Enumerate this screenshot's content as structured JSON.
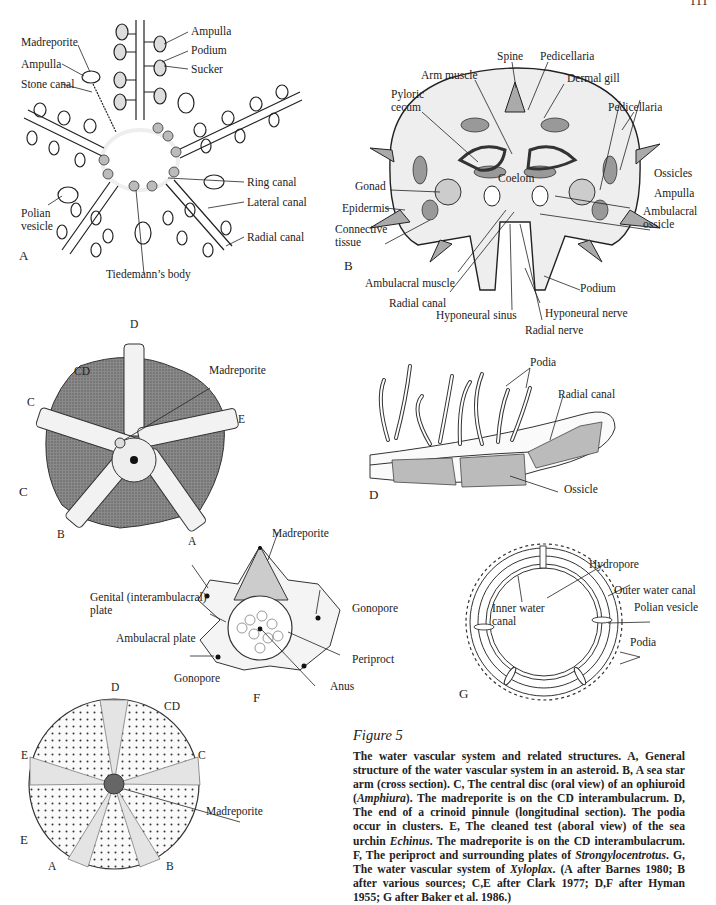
{
  "page": {
    "page_number": "111"
  },
  "figure": {
    "title": "Figure 5",
    "caption_parts": [
      {
        "t": "The water vascular system and related structures. A, General structure of the water vascular system in an asteroid. B, A sea star arm (cross section). C, The central disc (oral view) of an ophiuroid ("
      },
      {
        "t": "Amphiura",
        "i": true
      },
      {
        "t": "). The madreporite is on the CD interambulacrum. D, The end of a crinoid pinnule (longitudinal section). The podia occur in clusters. E, The cleaned test (aboral view) of the sea urchin "
      },
      {
        "t": "Echinus",
        "i": true
      },
      {
        "t": ". The madreporite is on the CD interambulacrum. F, The periproct and surrounding plates of "
      },
      {
        "t": "Strongylocentrotus",
        "i": true
      },
      {
        "t": ". G, The water vascular system of "
      },
      {
        "t": "Xyloplax",
        "i": true
      },
      {
        "t": ". (A after Barnes 1980; B after various sources; C,E after Clark 1977; D,F after Hyman 1955; G after Baker et al. 1986.)"
      }
    ]
  },
  "panels": {
    "A": {
      "letter": "A",
      "subject": "asteroid water vascular system",
      "labels": {
        "madreporite": "Madreporite",
        "ampulla_left": "Ampulla",
        "stone_canal": "Stone canal",
        "ampulla_right": "Ampulla",
        "podium": "Podium",
        "sucker": "Sucker",
        "ring_canal": "Ring canal",
        "lateral_canal": "Lateral canal",
        "radial_canal": "Radial canal",
        "polian_vesicle": "Polian vesicle",
        "tiedemanns_body": "Tiedemann’s body"
      }
    },
    "B": {
      "letter": "B",
      "subject": "sea star arm cross section",
      "labels": {
        "spine": "Spine",
        "pedicellaria_top": "Pedicellaria",
        "arm_muscle": "Arm muscle",
        "dermal_gill": "Dermal gill",
        "pyloric_cecum": "Pyloric cecum",
        "pedicellaria_right": "Pedicellaria",
        "ossicles": "Ossicles",
        "coelom": "Coelom",
        "gonad": "Gonad",
        "ampulla": "Ampulla",
        "epidermis": "Epidermis",
        "ambulacral_ossicle": "Ambulacral ossicle",
        "connective_tissue": "Connective tissue",
        "ambulacral_muscle": "Ambulacral muscle",
        "podium": "Podium",
        "radial_canal": "Radial canal",
        "hyponeural_nerve": "Hyponeural nerve",
        "hyponeural_sinus": "Hyponeural sinus",
        "radial_nerve": "Radial nerve"
      }
    },
    "C": {
      "letter": "C",
      "subject": "ophiuroid central disc (oral view)",
      "labels": {
        "D": "D",
        "CD": "CD",
        "C": "C",
        "E": "E",
        "B": "B",
        "A": "A",
        "madreporite": "Madreporite"
      }
    },
    "D": {
      "letter": "D",
      "subject": "crinoid pinnule (longitudinal section)",
      "labels": {
        "podia": "Podia",
        "radial_canal": "Radial canal",
        "ossicle": "Ossicle"
      }
    },
    "E": {
      "letter": "E",
      "subject": "sea urchin test (aboral view)",
      "labels": {
        "D": "D",
        "CD": "CD",
        "E": "E",
        "C": "C",
        "A": "A",
        "B": "B",
        "madreporite": "Madreporite"
      }
    },
    "F": {
      "letter": "F",
      "subject": "periproct and surrounding plates",
      "labels": {
        "madreporite": "Madreporite",
        "genital_plate": "Genital (interambulacral) plate",
        "gonopore_right": "Gonopore",
        "ambulacral_plate": "Ambulacral plate",
        "periproct": "Periproct",
        "gonopore_left": "Gonopore",
        "anus": "Anus"
      }
    },
    "G": {
      "letter": "G",
      "subject": "Xyloplax water vascular system",
      "labels": {
        "hydropore": "Hydropore",
        "outer_water_canal": "Outer water canal",
        "inner_water_canal": "Inner water canal",
        "polian_vesicle": "Polian vesicle",
        "podia": "Podia"
      }
    }
  }
}
